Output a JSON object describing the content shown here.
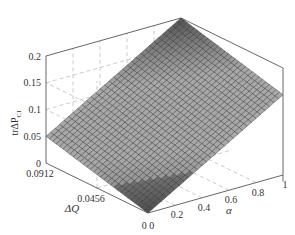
{
  "chart_data": {
    "type": "surface3d",
    "title": "",
    "xlabel": "α",
    "ylabel": "ΔQ",
    "zlabel": "trΔP_CI",
    "x_ticks": [
      "0",
      "0.2",
      "0.4",
      "0.6",
      "0.8",
      "1"
    ],
    "y_ticks": [
      "0",
      "0.0456",
      "0.0912"
    ],
    "z_ticks": [
      "0",
      "0.05",
      "0.1",
      "0.15",
      "0.2"
    ],
    "xlim": [
      0,
      1
    ],
    "ylim": [
      0,
      0.0912
    ],
    "zlim": [
      0,
      0.2
    ],
    "grid": true,
    "colormap": "gray",
    "surface_corners": [
      {
        "alpha": 0,
        "dQ": 0,
        "z": 0.0
      },
      {
        "alpha": 0,
        "dQ": 0.0912,
        "z": 0.05
      },
      {
        "alpha": 1,
        "dQ": 0,
        "z": 0.15
      },
      {
        "alpha": 1,
        "dQ": 0.0912,
        "z": 0.2
      }
    ],
    "mesh": {
      "alpha_steps": 30,
      "dQ_steps": 30
    }
  },
  "labels": {
    "z_axis": "trΔP",
    "z_axis_sub": "CI",
    "y_axis": "ΔQ",
    "x_axis": "α",
    "origin_label": "0 0"
  }
}
